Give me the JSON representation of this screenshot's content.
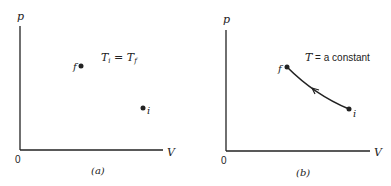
{
  "figure": {
    "panels": [
      {
        "id": "a",
        "caption": "(a)",
        "y_axis_label": "p",
        "x_axis_label": "V",
        "origin_label": "0",
        "annotation": "T",
        "annotation_sub_left": "i",
        "annotation_eq": " = ",
        "annotation_right": "T",
        "annotation_sub_right": "f",
        "points": [
          {
            "label": "f",
            "x": 81,
            "y": 66
          },
          {
            "label": "i",
            "x": 143,
            "y": 108
          }
        ],
        "path": null
      },
      {
        "id": "b",
        "caption": "(b)",
        "y_axis_label": "p",
        "x_axis_label": "V",
        "origin_label": "0",
        "annotation_var": "T",
        "annotation_rest": " = a constant",
        "points": [
          {
            "label": "f",
            "x": 287,
            "y": 67
          },
          {
            "label": "i",
            "x": 349,
            "y": 109
          }
        ],
        "path": {
          "type": "isotherm",
          "direction": "i-to-f"
        }
      }
    ],
    "colors": {
      "ink": "#222222",
      "background": "#ffffff"
    }
  }
}
